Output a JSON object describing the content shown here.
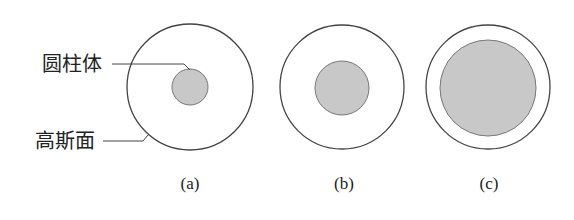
{
  "labels": {
    "cylinder": "圆柱体",
    "gaussian_surface": "高斯面"
  },
  "figures": [
    {
      "caption": "(a)",
      "outer": {
        "cx": 190,
        "cy": 87,
        "r": 63
      },
      "inner": {
        "cx": 190,
        "cy": 87,
        "r": 18
      }
    },
    {
      "caption": "(b)",
      "outer": {
        "cx": 342,
        "cy": 87,
        "r": 62
      },
      "inner": {
        "cx": 342,
        "cy": 88,
        "r": 27
      }
    },
    {
      "caption": "(c)",
      "outer": {
        "cx": 488,
        "cy": 87,
        "r": 62
      },
      "inner": {
        "cx": 488,
        "cy": 88,
        "r": 48
      }
    }
  ],
  "colors": {
    "stroke": "#444444",
    "fill": "#c8c8c8",
    "text": "#222222"
  }
}
